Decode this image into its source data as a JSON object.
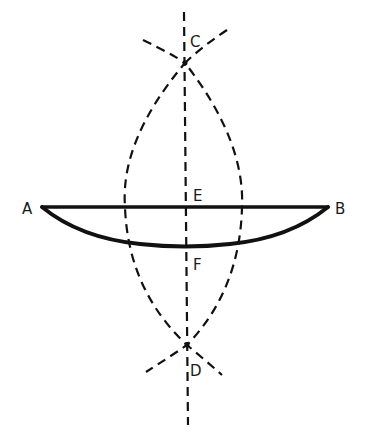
{
  "diagram": {
    "title": "",
    "colors": {
      "stroke": "#111111",
      "background": "#ffffff",
      "label": "#1a1a1a"
    },
    "points": {
      "A": {
        "label": "A",
        "x": 42,
        "y": 207
      },
      "B": {
        "label": "B",
        "x": 328,
        "y": 207
      },
      "C": {
        "label": "C",
        "x": 185,
        "y": 63
      },
      "D": {
        "label": "D",
        "x": 187,
        "y": 345
      },
      "E": {
        "label": "E",
        "x": 185,
        "y": 207
      },
      "F": {
        "label": "F",
        "x": 185,
        "y": 247
      }
    },
    "elements": [
      {
        "type": "chord",
        "from": "A",
        "to": "B",
        "style": "solid"
      },
      {
        "type": "arc",
        "from": "A",
        "to": "B",
        "through": "F",
        "style": "solid"
      },
      {
        "type": "line",
        "through": [
          "C",
          "D"
        ],
        "style": "dashed",
        "role": "perpendicular bisector"
      },
      {
        "type": "arc",
        "center": "A",
        "style": "dashed",
        "crosses": [
          "C",
          "D"
        ]
      },
      {
        "type": "arc",
        "center": "B",
        "style": "dashed",
        "crosses": [
          "C",
          "D"
        ]
      }
    ]
  }
}
